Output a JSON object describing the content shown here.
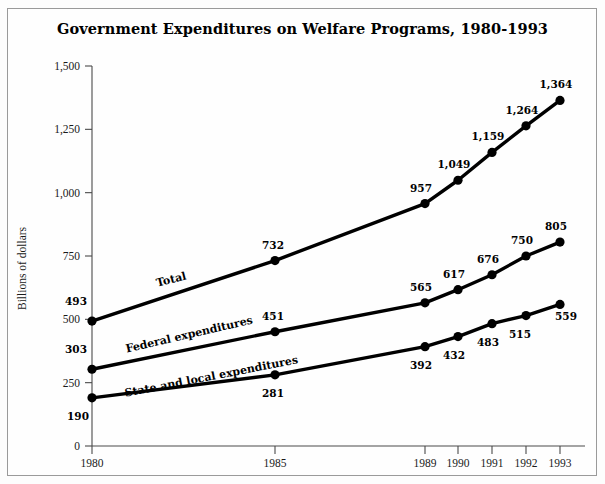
{
  "chart_data": {
    "type": "line",
    "title": "Government Expenditures on Welfare Programs, 1980-1993",
    "xlabel": "",
    "ylabel": "Billions of dollars",
    "x": [
      1980,
      1985,
      1989,
      1990,
      1991,
      1992,
      1993
    ],
    "categories": [
      "1980",
      "1985",
      "1989",
      "1990",
      "1991",
      "1992",
      "1993"
    ],
    "xtick_labels": [
      "1980",
      "1985",
      "1989",
      "1990",
      "1991",
      "1992",
      "1993"
    ],
    "ytick_labels": [
      "0",
      "250",
      "500",
      "750",
      "1,000",
      "1,250",
      "1,500"
    ],
    "yticks": [
      0,
      250,
      500,
      750,
      1000,
      1250,
      1500
    ],
    "ylim": [
      0,
      1500
    ],
    "xlim": [
      1980,
      1993
    ],
    "grid": false,
    "legend_position": "inline-on-lines",
    "series": [
      {
        "name": "Total",
        "values": [
          493,
          732,
          957,
          1049,
          1159,
          1264,
          1364
        ],
        "value_labels": [
          "493",
          "732",
          "957",
          "1,049",
          "1,159",
          "1,264",
          "1,364"
        ],
        "color": "#000000"
      },
      {
        "name": "Federal expenditures",
        "values": [
          303,
          451,
          565,
          617,
          676,
          750,
          805
        ],
        "value_labels": [
          "303",
          "451",
          "565",
          "617",
          "676",
          "750",
          "805"
        ],
        "color": "#000000"
      },
      {
        "name": "State and local expenditures",
        "values": [
          190,
          281,
          392,
          432,
          483,
          515,
          559
        ],
        "value_labels": [
          "190",
          "281",
          "392",
          "432",
          "483",
          "515",
          "559"
        ],
        "color": "#000000"
      }
    ]
  },
  "layout": {
    "x_pixels": [
      92,
      275,
      425,
      458,
      492,
      526,
      560
    ],
    "y_zero_px": 446,
    "y_top_px": 66,
    "y_top_value": 1500,
    "axis_right_px": 585,
    "series_name_positions": [
      {
        "x": 172,
        "y": 283,
        "rotate": -14
      },
      {
        "x": 190,
        "y": 338,
        "rotate": -13
      },
      {
        "x": 212,
        "y": 380,
        "rotate": -11
      }
    ],
    "value_label_offsets": [
      [
        [
          -16,
          -16
        ],
        [
          -2,
          -12
        ],
        [
          -4,
          -12
        ],
        [
          -4,
          -12
        ],
        [
          -4,
          -12
        ],
        [
          -4,
          -12
        ],
        [
          -4,
          -12
        ]
      ],
      [
        [
          -16,
          -16
        ],
        [
          -2,
          -12
        ],
        [
          -4,
          -12
        ],
        [
          -4,
          -12
        ],
        [
          -4,
          -12
        ],
        [
          -4,
          -12
        ],
        [
          -4,
          -12
        ]
      ],
      [
        [
          -14,
          22
        ],
        [
          -2,
          22
        ],
        [
          -4,
          22
        ],
        [
          -4,
          22
        ],
        [
          -4,
          22
        ],
        [
          -6,
          22
        ],
        [
          6,
          16
        ]
      ]
    ]
  }
}
